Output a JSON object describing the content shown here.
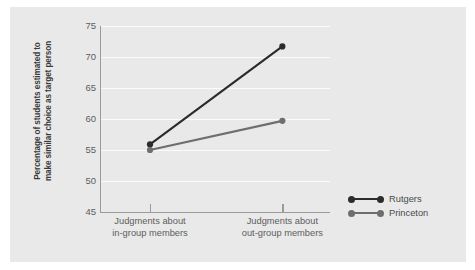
{
  "figure": {
    "background_color": "#ffffff",
    "panel_color": "#e9e9e9"
  },
  "chart_data": {
    "type": "line",
    "title": "",
    "subtitle": "",
    "xlabel": "",
    "ylabel": "Percentage of students estimated to make similar choice as target person",
    "ylabel_line1": "Percentage of students estimated to",
    "ylabel_line2": "make similar choice as target person",
    "categories": [
      "Judgments about in-group members",
      "Judgments about out-group members"
    ],
    "category_labels": [
      {
        "line1": "Judgments about",
        "line2": "in-group members"
      },
      {
        "line1": "Judgments about",
        "line2": "out-group members"
      }
    ],
    "series": [
      {
        "name": "Rutgers",
        "values": [
          55.9,
          71.7
        ],
        "color": "#2b2b2b"
      },
      {
        "name": "Princeton",
        "values": [
          55.0,
          59.7
        ],
        "color": "#6e6e6e"
      }
    ],
    "ylim": [
      45,
      75
    ],
    "yticks": [
      45,
      50,
      55,
      60,
      65,
      70,
      75
    ],
    "ytick_labels": [
      "45",
      "50",
      "55",
      "60",
      "65",
      "70",
      "75"
    ],
    "grid": true,
    "grid_color": "#fbfbfb",
    "legend_position": "bottom-right",
    "axis_color": "#9a9a9a",
    "tick_text_color": "#5d5d5d"
  },
  "legend": {
    "entries": [
      {
        "label": "Rutgers",
        "color": "#2b2b2b"
      },
      {
        "label": "Princeton",
        "color": "#6e6e6e"
      }
    ]
  }
}
